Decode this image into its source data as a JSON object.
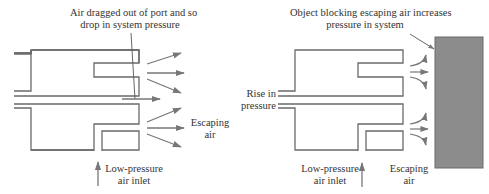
{
  "left_diagram": {
    "annotation_top": [
      "Air dragged out of port and so",
      "drop in system pressure"
    ],
    "escaping_label": [
      "Escaping",
      "air"
    ],
    "inlet_label": [
      "Low-pressure",
      "air inlet"
    ]
  },
  "right_diagram": {
    "annotation_top": [
      "Object blocking escaping air increases",
      "pressure in system"
    ],
    "rise_label": [
      "Rise in",
      "pressure"
    ],
    "inlet_label": [
      "Low-pressure",
      "air inlet"
    ],
    "escaping_label": [
      "Escaping",
      "air"
    ]
  },
  "colors": {
    "line": "#6a6a6a",
    "arrow": "#777777",
    "block_fill": "#8c8c8c",
    "block_stroke": "#6a6a6a"
  }
}
